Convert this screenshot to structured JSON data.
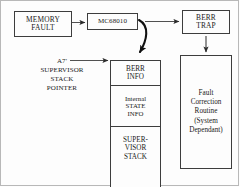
{
  "diagram": {
    "ink_color": "#1a1a1a",
    "line_color": "#3d3d3d",
    "background": "#fdfdfd",
    "nodes": {
      "memory_fault": {
        "line1": "MEMORY",
        "line2": "FAULT"
      },
      "processor": {
        "line1": "MC68010"
      },
      "berr_trap": {
        "line1": "BERR",
        "line2": "TRAP"
      },
      "fault_routine": {
        "line1": "Fault",
        "line2": "Correction",
        "line3": "Routine",
        "line4": "(System",
        "line5": "Dependant)"
      },
      "stack_pointer_label": {
        "line1": "A7'",
        "line2": "SUPERVISOR",
        "line3": "STACK",
        "line4": "POINTER"
      },
      "stack": {
        "berr_info": {
          "line1": "BERR",
          "line2": "INFO"
        },
        "state_info": {
          "line1": "Internal",
          "line2": "STATE",
          "line3": "INFO"
        },
        "supervisor_stack": {
          "line1": "SUPER-",
          "line2": "VISOR",
          "line3": "STACK"
        }
      }
    },
    "edges": [
      {
        "name": "memory-fault-to-processor",
        "from": "memory_fault",
        "to": "processor",
        "style": "straight-arrow"
      },
      {
        "name": "processor-to-berr-trap",
        "from": "processor",
        "to": "berr_trap",
        "style": "straight-arrow"
      },
      {
        "name": "processor-to-stack",
        "from": "processor",
        "to": "stack.berr_info",
        "style": "curved-arrow"
      },
      {
        "name": "berr-trap-to-fault-routine",
        "from": "berr_trap",
        "to": "fault_routine",
        "style": "straight-arrow"
      },
      {
        "name": "stack-pointer-to-stack-top",
        "from": "stack_pointer_label",
        "to": "stack.berr_info",
        "style": "straight-arrow"
      }
    ]
  }
}
